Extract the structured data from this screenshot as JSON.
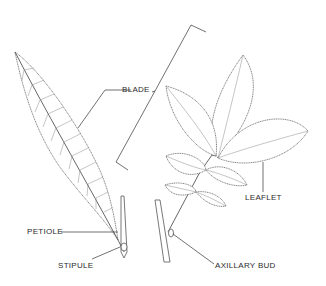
{
  "diagram": {
    "title": "",
    "labels": {
      "blade": "BLADE",
      "leaflet": "LEAFLET",
      "petiole": "PETIOLE",
      "stipule": "STIPULE",
      "axillary_bud": "AXILLARY BUD"
    },
    "figures": [
      {
        "name": "simple-leaf",
        "parts": [
          "blade",
          "petiole",
          "stipule"
        ]
      },
      {
        "name": "compound-leaf",
        "parts": [
          "leaflet",
          "axillary_bud"
        ],
        "leaflet_count": 7
      }
    ],
    "colors": {
      "background": "#ffffff",
      "line": "#555555",
      "text": "#2a2a2a"
    }
  }
}
